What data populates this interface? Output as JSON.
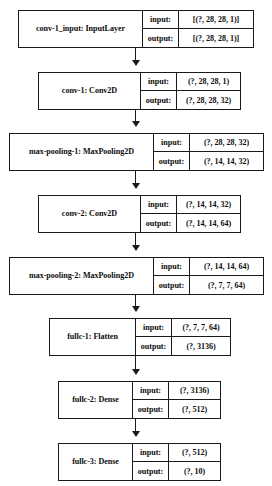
{
  "diagram": {
    "io_labels": {
      "input": "input:",
      "output": "output:"
    },
    "layers": [
      {
        "name": "conv-1_input: InputLayer",
        "input_shape": "[(?, 28, 28, 1)]",
        "output_shape": "[(?, 28, 28, 1)]"
      },
      {
        "name": "conv-1: Conv2D",
        "input_shape": "(?, 28, 28, 1)",
        "output_shape": "(?, 28, 28, 32)"
      },
      {
        "name": "max-pooling-1: MaxPooling2D",
        "input_shape": "(?, 28, 28, 32)",
        "output_shape": "(?, 14, 14, 32)"
      },
      {
        "name": "conv-2: Conv2D",
        "input_shape": "(?, 14, 14, 32)",
        "output_shape": "(?, 14, 14, 64)"
      },
      {
        "name": "max-pooling-2: MaxPooling2D",
        "input_shape": "(?, 14, 14, 64)",
        "output_shape": "(?, 7, 7, 64)"
      },
      {
        "name": "fullc-1: Flatten",
        "input_shape": "(?, 7, 7, 64)",
        "output_shape": "(?, 3136)"
      },
      {
        "name": "fullc-2: Dense",
        "input_shape": "(?, 3136)",
        "output_shape": "(?, 512)"
      },
      {
        "name": "fullc-3: Dense",
        "input_shape": "(?, 512)",
        "output_shape": "(?, 10)"
      }
    ],
    "edges": [
      {
        "from": "conv-1_input: InputLayer",
        "to": "conv-1: Conv2D"
      },
      {
        "from": "conv-1: Conv2D",
        "to": "max-pooling-1: MaxPooling2D"
      },
      {
        "from": "max-pooling-1: MaxPooling2D",
        "to": "conv-2: Conv2D"
      },
      {
        "from": "conv-2: Conv2D",
        "to": "max-pooling-2: MaxPooling2D"
      },
      {
        "from": "max-pooling-2: MaxPooling2D",
        "to": "fullc-1: Flatten"
      },
      {
        "from": "fullc-1: Flatten",
        "to": "fullc-2: Dense"
      },
      {
        "from": "fullc-2: Dense",
        "to": "fullc-3: Dense"
      }
    ],
    "colors": {
      "stroke": "#1a1a1a",
      "fill": "#ffffff",
      "text": "#0d0d0d"
    }
  },
  "layout": {
    "boxes": [
      {
        "left": 18,
        "top": 10,
        "width": 236,
        "height": 38,
        "name_width": 123,
        "label_width": 35
      },
      {
        "left": 38,
        "top": 72,
        "width": 203,
        "height": 38,
        "name_width": 101,
        "label_width": 35
      },
      {
        "left": 9,
        "top": 133,
        "width": 255,
        "height": 38,
        "name_width": 143,
        "label_width": 35
      },
      {
        "left": 38,
        "top": 195,
        "width": 203,
        "height": 38,
        "name_width": 101,
        "label_width": 35
      },
      {
        "left": 9,
        "top": 257,
        "width": 255,
        "height": 38,
        "name_width": 143,
        "label_width": 35
      },
      {
        "left": 49,
        "top": 318,
        "width": 182,
        "height": 38,
        "name_width": 85,
        "label_width": 35
      },
      {
        "left": 58,
        "top": 381,
        "width": 163,
        "height": 38,
        "name_width": 73,
        "label_width": 35
      },
      {
        "left": 58,
        "top": 443,
        "width": 163,
        "height": 38,
        "name_width": 73,
        "label_width": 35
      }
    ],
    "connector_x": 136,
    "connectors": [
      {
        "top": 48,
        "height": 18
      },
      {
        "top": 110,
        "height": 17
      },
      {
        "top": 171,
        "height": 18
      },
      {
        "top": 233,
        "height": 18
      },
      {
        "top": 295,
        "height": 17
      },
      {
        "top": 356,
        "height": 19
      },
      {
        "top": 419,
        "height": 18
      }
    ]
  }
}
